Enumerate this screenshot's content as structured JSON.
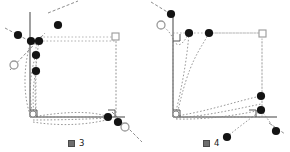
{
  "figure": {
    "background_color": "#ffffff",
    "axis_color": "#808080",
    "dot_color": "#111111",
    "open_marker_color": "#999999",
    "dotted_color": "#9a9a9a",
    "guide_color": "#666666",
    "panels": [
      {
        "id": "figure-3",
        "caption_glyph": "図",
        "caption_number": "3",
        "caption_text": "図 3",
        "origin": {
          "x": 30,
          "y": 117
        },
        "axes": {
          "vertical": {
            "x1": 30,
            "y1": 12,
            "x2": 30,
            "y2": 117
          },
          "horizontal": {
            "x1": 30,
            "y1": 117,
            "x2": 125,
            "y2": 117
          }
        },
        "square_marker": {
          "x": 116,
          "y": 33,
          "size": 7
        },
        "right_angle_markers": [
          {
            "x": 30,
            "y": 117,
            "dir": "bl"
          },
          {
            "x": 113,
            "y": 117,
            "dir": "br"
          }
        ],
        "open_circles": [
          {
            "x": 14,
            "y": 65,
            "r": 4
          },
          {
            "x": 125,
            "y": 127,
            "r": 4
          }
        ],
        "dots": [
          {
            "x": 31,
            "y": 41,
            "r": 4
          },
          {
            "x": 39,
            "y": 41,
            "r": 4
          },
          {
            "x": 58,
            "y": 25,
            "r": 4
          },
          {
            "x": 18,
            "y": 35,
            "r": 4
          },
          {
            "x": 36,
            "y": 55,
            "r": 4
          },
          {
            "x": 36,
            "y": 71,
            "r": 4
          },
          {
            "x": 108,
            "y": 117,
            "r": 4
          },
          {
            "x": 118,
            "y": 122,
            "r": 4
          }
        ],
        "guide_lines": [
          {
            "x1": 48,
            "y1": 13,
            "x2": 76,
            "y2": 1
          },
          {
            "x1": 5,
            "y1": 28,
            "x2": 35,
            "y2": 45
          },
          {
            "x1": 10,
            "y1": 70,
            "x2": 44,
            "y2": 35
          },
          {
            "x1": 112,
            "y1": 113,
            "x2": 140,
            "y2": 140
          }
        ],
        "dotted_rect": {
          "x": 36,
          "y": 41,
          "w": 80,
          "h": 76
        }
      },
      {
        "id": "figure-4",
        "caption_glyph": "図",
        "caption_number": "4",
        "caption_text": "図 4",
        "origin": {
          "x": 28,
          "y": 117
        },
        "axes": {
          "vertical": {
            "x1": 28,
            "y1": 12,
            "x2": 28,
            "y2": 117
          },
          "horizontal": {
            "x1": 28,
            "y1": 117,
            "x2": 130,
            "y2": 117
          }
        },
        "square_marker": {
          "x": 117,
          "y": 33,
          "size": 7
        },
        "right_angle_markers": [
          {
            "x": 28,
            "y": 117,
            "dir": "bl"
          },
          {
            "x": 28,
            "y": 41,
            "dir": "tl"
          },
          {
            "x": 108,
            "y": 117,
            "dir": "br"
          }
        ],
        "open_circles": [
          {
            "x": 16,
            "y": 25,
            "r": 4
          }
        ],
        "dots": [
          {
            "x": 26,
            "y": 14,
            "r": 4
          },
          {
            "x": 44,
            "y": 33,
            "r": 4
          },
          {
            "x": 64,
            "y": 33,
            "r": 4
          },
          {
            "x": 116,
            "y": 96,
            "r": 4
          },
          {
            "x": 116,
            "y": 110,
            "r": 4
          },
          {
            "x": 82,
            "y": 137,
            "r": 4
          },
          {
            "x": 131,
            "y": 131,
            "r": 4
          }
        ],
        "guide_lines": [
          {
            "x1": 6,
            "y1": 2,
            "x2": 24,
            "y2": 14
          },
          {
            "x1": 124,
            "y1": 124,
            "x2": 140,
            "y2": 134
          }
        ],
        "dotted_rect": {
          "x": 28,
          "y": 33,
          "w": 89,
          "h": 84
        }
      }
    ]
  }
}
